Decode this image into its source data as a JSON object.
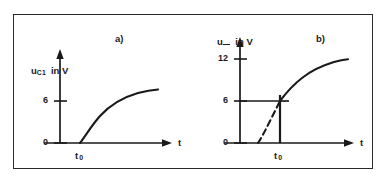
{
  "figure": {
    "panels": [
      {
        "tag": "a)",
        "y_axis": {
          "quantity": "u",
          "subscript": "C1",
          "units_text": "in V",
          "ticks": [
            {
              "value": 0,
              "label": "0"
            },
            {
              "value": 6,
              "label": "6"
            }
          ],
          "max": 9
        },
        "x_axis": {
          "label": "t",
          "marker_label": "t",
          "marker_subscript": "0"
        },
        "curve": {
          "style": "solid",
          "description": "rising saturating exponential starting at t0 from 0 approaching 6",
          "start_value": 0,
          "asymptote": 6
        }
      },
      {
        "tag": "b)",
        "y_axis": {
          "quantity": "u",
          "subscript": "",
          "units_text": "in V",
          "ticks": [
            {
              "value": 0,
              "label": "0"
            },
            {
              "value": 6,
              "label": "6"
            },
            {
              "value": 12,
              "label": "12"
            }
          ],
          "max": 15
        },
        "x_axis": {
          "label": "t",
          "marker_label": "t",
          "marker_subscript": "0"
        },
        "curve": {
          "style": "dashed-then-solid",
          "description": "rising saturating exponential, dashed before t0, solid after t0, crossing 6 at t0 and approaching 12",
          "value_at_t0": 6,
          "asymptote": 12
        },
        "guides": {
          "horizontal_at": 6,
          "vertical_at": "t0"
        }
      }
    ],
    "colors": {
      "ink": "#1a1a1a",
      "frame": "#2b2b2b",
      "background": "#ffffff"
    }
  }
}
